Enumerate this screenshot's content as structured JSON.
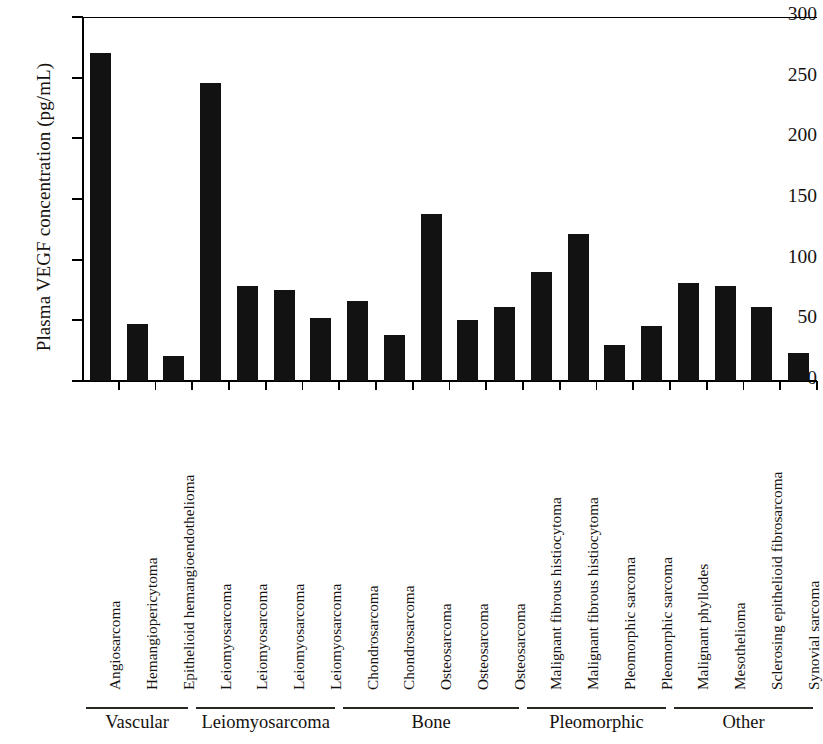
{
  "chart_data": {
    "type": "bar",
    "title": "",
    "xlabel": "",
    "ylabel": "Plasma VEGF concentration (pg/mL)",
    "ylim": [
      0,
      300
    ],
    "yticks": [
      0,
      50,
      100,
      150,
      200,
      250,
      300
    ],
    "ytick_labels": [
      "0",
      "50",
      "100",
      "150",
      "200",
      "250",
      "300"
    ],
    "grid": false,
    "legend": null,
    "bar_color": "#121212",
    "categories": [
      "Angiosarcoma",
      "Hemangiopericytoma",
      "Epithelioid hemangioendothelioma",
      "Leiomyosarcoma",
      "Leiomyosarcoma",
      "Leiomyosarcoma",
      "Leiomyosarcoma",
      "Chondrosarcoma",
      "Chondrosarcoma",
      "Osteosarcoma",
      "Osteosarcoma",
      "Osteosarcoma",
      "Malignant fibrous histiocytoma",
      "Malignant fibrous histiocytoma",
      "Pleomorphic sarcoma",
      "Pleomorphic sarcoma",
      "Malignant phyllodes",
      "Mesothelioma",
      "Sclerosing epithelioid fibrosarcoma",
      "Synovial sarcoma"
    ],
    "values": [
      270,
      47,
      21,
      246,
      78,
      75,
      52,
      66,
      38,
      138,
      50,
      61,
      90,
      121,
      30,
      45,
      81,
      78,
      61,
      23
    ],
    "groups": [
      {
        "label": "Vascular",
        "start_index": 0,
        "end_index": 2
      },
      {
        "label": "Leiomyosarcoma",
        "start_index": 3,
        "end_index": 6
      },
      {
        "label": "Bone",
        "start_index": 7,
        "end_index": 11
      },
      {
        "label": "Pleomorphic",
        "start_index": 12,
        "end_index": 15
      },
      {
        "label": "Other",
        "start_index": 16,
        "end_index": 19
      }
    ]
  }
}
